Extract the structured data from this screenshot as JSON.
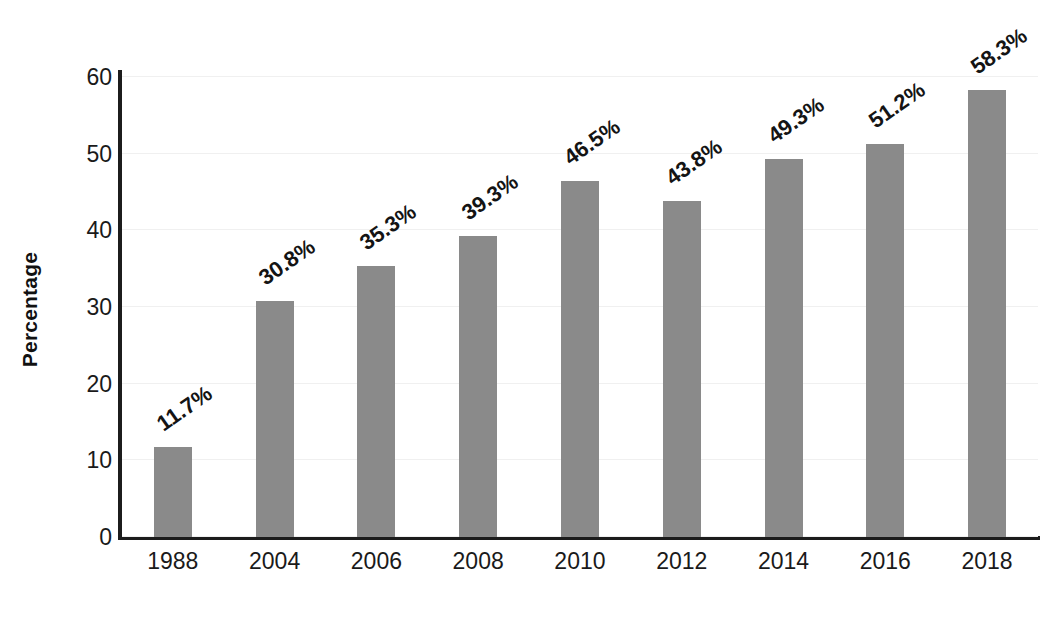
{
  "chart_data": {
    "type": "bar",
    "title": "",
    "xlabel": "",
    "ylabel": "Percentage",
    "categories": [
      "1988",
      "2004",
      "2006",
      "2008",
      "2010",
      "2012",
      "2014",
      "2016",
      "2018"
    ],
    "values": [
      11.7,
      30.8,
      35.3,
      39.3,
      46.5,
      43.8,
      49.3,
      51.2,
      58.3
    ],
    "value_labels": [
      "11.7%",
      "30.8%",
      "35.3%",
      "39.3%",
      "46.5%",
      "43.8%",
      "49.3%",
      "51.2%",
      "58.3%"
    ],
    "ylim": [
      0,
      60
    ],
    "yticks": [
      0,
      10,
      20,
      30,
      40,
      50,
      60
    ],
    "ytick_labels": [
      "0",
      "10",
      "20",
      "30",
      "40",
      "50",
      "60"
    ],
    "grid": true,
    "legend": null,
    "bar_color": "#8a8a8a",
    "axis_color": "#1c1c1c",
    "grid_color": "#f0f0f0",
    "background": "#ffffff",
    "value_label_rotation": -35
  }
}
